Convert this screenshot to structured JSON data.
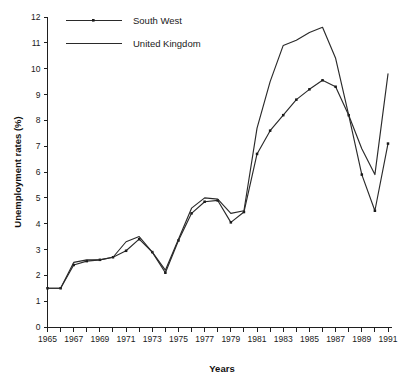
{
  "chart_data": {
    "type": "line",
    "title": "",
    "xlabel": "Years",
    "ylabel": "Unemployment rates (%)",
    "xlim": [
      1965,
      1991
    ],
    "ylim": [
      0,
      12
    ],
    "grid": false,
    "legend_position": "top-left",
    "x": [
      1965,
      1966,
      1967,
      1968,
      1969,
      1970,
      1971,
      1972,
      1973,
      1974,
      1975,
      1976,
      1977,
      1978,
      1979,
      1980,
      1981,
      1982,
      1983,
      1984,
      1985,
      1986,
      1987,
      1988,
      1989,
      1990,
      1991
    ],
    "xtick_values": [
      1965,
      1967,
      1969,
      1971,
      1973,
      1975,
      1977,
      1979,
      1981,
      1983,
      1985,
      1987,
      1989,
      1991
    ],
    "xtick_labels": [
      "1965",
      "1967",
      "1969",
      "1971",
      "1973",
      "1975",
      "1977",
      "1979",
      "1981",
      "1983",
      "1985",
      "1987",
      "1989",
      "1991"
    ],
    "xtick_minor_values": [
      1966,
      1968,
      1970,
      1972,
      1974,
      1976,
      1978,
      1980,
      1982,
      1984,
      1986,
      1988,
      1990
    ],
    "ytick_values": [
      0,
      1,
      2,
      3,
      4,
      5,
      6,
      7,
      8,
      9,
      10,
      11,
      12
    ],
    "ytick_labels": [
      "0",
      "1",
      "2",
      "3",
      "4",
      "5",
      "6",
      "7",
      "8",
      "9",
      "10",
      "11",
      "12"
    ],
    "series": [
      {
        "name": "South West",
        "marker": "square",
        "color": "#2a2a2a",
        "values": [
          1.5,
          1.5,
          2.4,
          2.55,
          2.6,
          2.7,
          2.95,
          3.4,
          2.9,
          2.1,
          3.35,
          4.4,
          4.85,
          4.9,
          4.05,
          4.45,
          6.7,
          7.6,
          8.2,
          8.8,
          9.2,
          9.55,
          9.3,
          8.2,
          5.9,
          4.5,
          7.1
        ]
      },
      {
        "name": "United Kingdom",
        "marker": "none",
        "color": "#2a2a2a",
        "values": [
          1.5,
          1.5,
          2.5,
          2.6,
          2.6,
          2.7,
          3.3,
          3.5,
          2.9,
          2.2,
          3.4,
          4.6,
          5.0,
          4.95,
          4.4,
          4.5,
          7.7,
          9.5,
          10.9,
          11.1,
          11.4,
          11.6,
          10.4,
          8.2,
          6.9,
          5.9,
          9.8
        ]
      }
    ]
  },
  "legend": {
    "entries": [
      {
        "label": "South West"
      },
      {
        "label": "United Kingdom"
      }
    ]
  },
  "axes": {
    "y_title": "Unemployment rates (%)",
    "x_title": "Years"
  }
}
